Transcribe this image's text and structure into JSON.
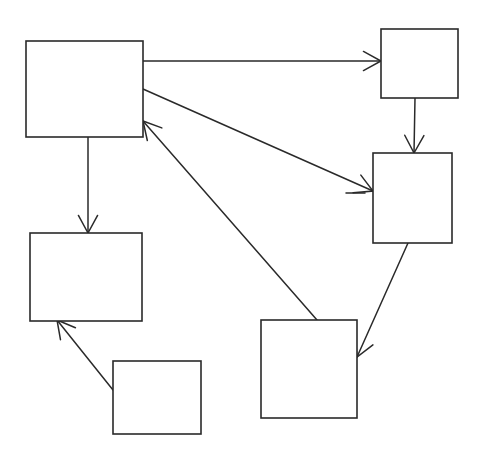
{
  "diagram": {
    "type": "directed-graph",
    "title": "",
    "nodes": [
      {
        "id": "A",
        "label": ""
      },
      {
        "id": "B",
        "label": ""
      },
      {
        "id": "C",
        "label": ""
      },
      {
        "id": "D",
        "label": ""
      },
      {
        "id": "E",
        "label": ""
      },
      {
        "id": "F",
        "label": ""
      }
    ],
    "edges": [
      {
        "from": "A",
        "to": "B"
      },
      {
        "from": "B",
        "to": "C"
      },
      {
        "from": "A",
        "to": "C"
      },
      {
        "from": "A",
        "to": "D"
      },
      {
        "from": "F",
        "to": "A"
      },
      {
        "from": "C",
        "to": "F"
      },
      {
        "from": "E",
        "to": "D"
      }
    ],
    "colors": {
      "stroke": "#2a2a2a",
      "background": "#ffffff"
    }
  }
}
